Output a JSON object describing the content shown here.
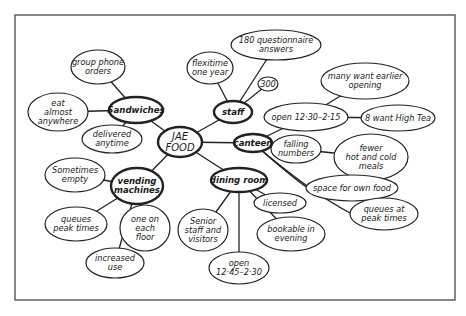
{
  "diagram": {
    "type": "mind-map",
    "center": {
      "id": "jae",
      "lines": [
        "JAE",
        "FOOD"
      ],
      "x": 180,
      "y": 142,
      "rx": 22,
      "ry": 15
    },
    "hubs": [
      {
        "id": "sandwiches",
        "lines": [
          "Sandwiches"
        ],
        "x": 136,
        "y": 110,
        "rx": 27,
        "ry": 13,
        "children": [
          {
            "id": "group-phone-orders",
            "lines": [
              "group phone",
              "orders"
            ],
            "x": 98,
            "y": 67,
            "rx": 27,
            "ry": 17
          },
          {
            "id": "eat-almost-anywhere",
            "lines": [
              "eat",
              "almost",
              "anywhere"
            ],
            "x": 58,
            "y": 112,
            "rx": 30,
            "ry": 19
          },
          {
            "id": "delivered-anytime",
            "lines": [
              "delivered",
              "anytime"
            ],
            "x": 112,
            "y": 139,
            "rx": 30,
            "ry": 14
          }
        ]
      },
      {
        "id": "staff",
        "lines": [
          "staff"
        ],
        "x": 233,
        "y": 112,
        "rx": 19,
        "ry": 11,
        "children": [
          {
            "id": "flexitime-one-year",
            "lines": [
              "flexitime",
              "one year"
            ],
            "x": 210,
            "y": 68,
            "rx": 23,
            "ry": 16
          },
          {
            "id": "questionnaire-answers",
            "lines": [
              "180 questionnaire",
              "answers"
            ],
            "x": 276,
            "y": 45,
            "rx": 45,
            "ry": 15
          },
          {
            "id": "staff-300",
            "lines": [
              "300"
            ],
            "x": 268,
            "y": 84,
            "rx": 10,
            "ry": 7
          }
        ]
      },
      {
        "id": "canteen",
        "lines": [
          "canteen"
        ],
        "x": 253,
        "y": 143,
        "rx": 19,
        "ry": 9,
        "children": [
          {
            "id": "open-1230-215",
            "lines": [
              "open 12·30–2·15"
            ],
            "x": 306,
            "y": 117,
            "rx": 42,
            "ry": 14,
            "children": [
              {
                "id": "many-want-earlier-opening",
                "lines": [
                  "many want earlier",
                  "opening"
                ],
                "x": 365,
                "y": 81,
                "rx": 44,
                "ry": 18
              },
              {
                "id": "8-want-high-tea",
                "lines": [
                  "8 want High Tea"
                ],
                "x": 398,
                "y": 118,
                "rx": 37,
                "ry": 13
              }
            ]
          },
          {
            "id": "falling-numbers",
            "lines": [
              "falling",
              "numbers"
            ],
            "x": 296,
            "y": 149,
            "rx": 25,
            "ry": 14,
            "children": [
              {
                "id": "fewer-hot-cold-meals",
                "lines": [
                  "fewer",
                  "hot and cold",
                  "meals"
                ],
                "x": 371,
                "y": 157,
                "rx": 37,
                "ry": 23
              }
            ]
          },
          {
            "id": "space-for-own-food",
            "lines": [
              "space for own food"
            ],
            "x": 352,
            "y": 188,
            "rx": 46,
            "ry": 13
          },
          {
            "id": "canteen-queues-peak",
            "lines": [
              "queues at",
              "peak times"
            ],
            "x": 384,
            "y": 214,
            "rx": 34,
            "ry": 16
          }
        ]
      },
      {
        "id": "vending-machines",
        "lines": [
          "vending",
          "machines"
        ],
        "x": 137,
        "y": 186,
        "rx": 26,
        "ry": 18,
        "children": [
          {
            "id": "sometimes-empty",
            "lines": [
              "Sometimes",
              "empty"
            ],
            "x": 75,
            "y": 175,
            "rx": 30,
            "ry": 17
          },
          {
            "id": "vending-queues-peak",
            "lines": [
              "queues",
              "peak times"
            ],
            "x": 76,
            "y": 224,
            "rx": 31,
            "ry": 17
          },
          {
            "id": "one-on-each-floor",
            "lines": [
              "one on",
              "each",
              "floor"
            ],
            "x": 145,
            "y": 228,
            "rx": 25,
            "ry": 23
          },
          {
            "id": "increased-use",
            "lines": [
              "increased",
              "use"
            ],
            "x": 115,
            "y": 263,
            "rx": 29,
            "ry": 15
          }
        ]
      },
      {
        "id": "dining-room",
        "lines": [
          "dining room"
        ],
        "x": 239,
        "y": 180,
        "rx": 28,
        "ry": 12,
        "children": [
          {
            "id": "licensed",
            "lines": [
              "licensed"
            ],
            "x": 280,
            "y": 203,
            "rx": 26,
            "ry": 10
          },
          {
            "id": "bookable-in-evening",
            "lines": [
              "bookable in",
              "evening"
            ],
            "x": 291,
            "y": 234,
            "rx": 34,
            "ry": 17
          },
          {
            "id": "senior-staff-visitors",
            "lines": [
              "Senior",
              "staff and",
              "visitors"
            ],
            "x": 203,
            "y": 230,
            "rx": 25,
            "ry": 21
          },
          {
            "id": "open-1245-230",
            "lines": [
              "open",
              "12·45–2·30"
            ],
            "x": 239,
            "y": 268,
            "rx": 30,
            "ry": 16
          }
        ]
      }
    ],
    "curved_edges": [
      {
        "from": "canteen",
        "to": "space-for-own-food"
      },
      {
        "from": "canteen",
        "to": "canteen-queues-peak"
      }
    ],
    "frame": {
      "x": 15,
      "y": 15,
      "width": 440,
      "height": 285
    }
  }
}
